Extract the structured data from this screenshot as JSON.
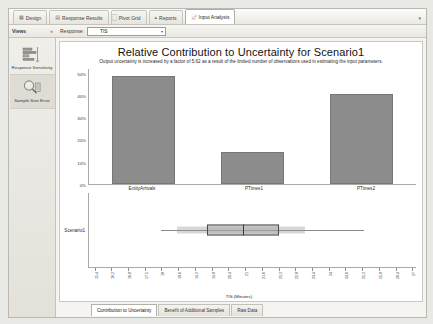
{
  "ribbon": {
    "tabs": [
      {
        "label": "Design",
        "icon": "grid-icon",
        "active": false
      },
      {
        "label": "Response Results",
        "icon": "table-icon",
        "active": false
      },
      {
        "label": "Pivot Grid",
        "icon": "pivot-icon",
        "active": false
      },
      {
        "label": "Reports",
        "icon": "chart-icon",
        "active": false
      },
      {
        "label": "Input Analysis",
        "icon": "analysis-icon",
        "active": true
      }
    ],
    "overflow_caret": "▾"
  },
  "subbar": {
    "views_label": "Views",
    "collapse_glyph": "«",
    "response_label": "Response:",
    "response_value": "TIS",
    "dropdown_caret": "▾"
  },
  "sidebar": {
    "items": [
      {
        "label": "Response Sensitivity",
        "icon": "bar-chart-icon",
        "selected": false
      },
      {
        "label": "Sample Size Error",
        "icon": "magnifier-icon",
        "selected": true
      }
    ]
  },
  "chart_data": {
    "type": "bar",
    "title": "Relative Contribution to Uncertainty for Scenario1",
    "subtitle": "Output uncertainty is increased by a factor of 5.62 as a result of the limited number of observations used in estimating the input parameters.",
    "categories": [
      "EntityArrivals",
      "PTimes1",
      "PTimes2"
    ],
    "values": [
      47,
      14,
      39
    ],
    "ylabel": "",
    "xlabel": "",
    "ylim": [
      0,
      50
    ],
    "yticks": [
      "50%",
      "40%",
      "30%",
      "20%",
      "10%",
      "0%"
    ],
    "ytick_values": [
      50,
      40,
      30,
      20,
      10,
      0
    ],
    "grid": false,
    "legend": "none",
    "bar_color": "#8c8c8c"
  },
  "boxplot": {
    "type": "box",
    "series_label": "Scenario1",
    "xlabel": "TIS (Minutes)",
    "xticks": [
      "15.4",
      "16.2",
      "16.8",
      "17.5",
      "18",
      "18.6",
      "19.2",
      "19.8",
      "20.4",
      "21",
      "21.6",
      "22.2",
      "22.8",
      "23.4",
      "24",
      "24.6",
      "25.2",
      "25.8",
      "26.4",
      "27"
    ],
    "whisker_min": 16.2,
    "q1": 19.4,
    "median": 20.4,
    "q3": 21.4,
    "whisker_max": 25.4
  },
  "bottom_tabs": [
    {
      "label": "Contribution to Uncertainty",
      "active": true
    },
    {
      "label": "Benefit of Additional Samples",
      "active": false
    },
    {
      "label": "Raw Data",
      "active": false
    }
  ]
}
